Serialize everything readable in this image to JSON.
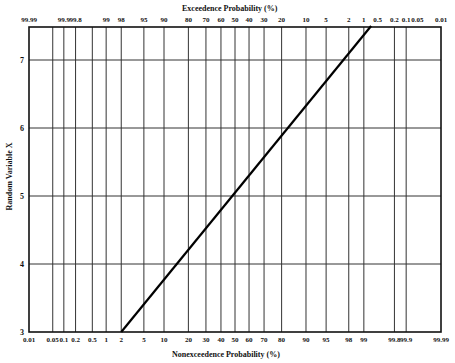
{
  "chart_data": {
    "type": "line",
    "title_top": "Exceedence Probability (%)",
    "xlabel": "Nonexceedence Probability (%)",
    "ylabel": "Random Variable X",
    "x_scale": "normal-probability",
    "top_ticks": [
      "99.99",
      "99.9",
      "99.8",
      "99",
      "98",
      "95",
      "90",
      "80",
      "70",
      "60",
      "50",
      "40",
      "30",
      "20",
      "10",
      "5",
      "2",
      "1",
      "0.5",
      "0.2",
      "0.1",
      "0.05",
      "0.01"
    ],
    "bottom_ticks": [
      "0.01",
      "0.05",
      "0.1",
      "0.2",
      "0.5",
      "1",
      "2",
      "5",
      "10",
      "20",
      "30",
      "40",
      "50",
      "60",
      "70",
      "80",
      "90",
      "95",
      "98",
      "99",
      "99.8",
      "99.9",
      "99.99"
    ],
    "y_ticks": [
      "3",
      "4",
      "5",
      "6",
      "7"
    ],
    "ylim": [
      3,
      7.5
    ],
    "grid": true,
    "series": [
      {
        "name": "Normal distribution line (mean 5, std dev 1)",
        "x_nonexceedance_pct": [
          2,
          50,
          99.3
        ],
        "y": [
          3.0,
          5.0,
          7.5
        ]
      }
    ]
  }
}
